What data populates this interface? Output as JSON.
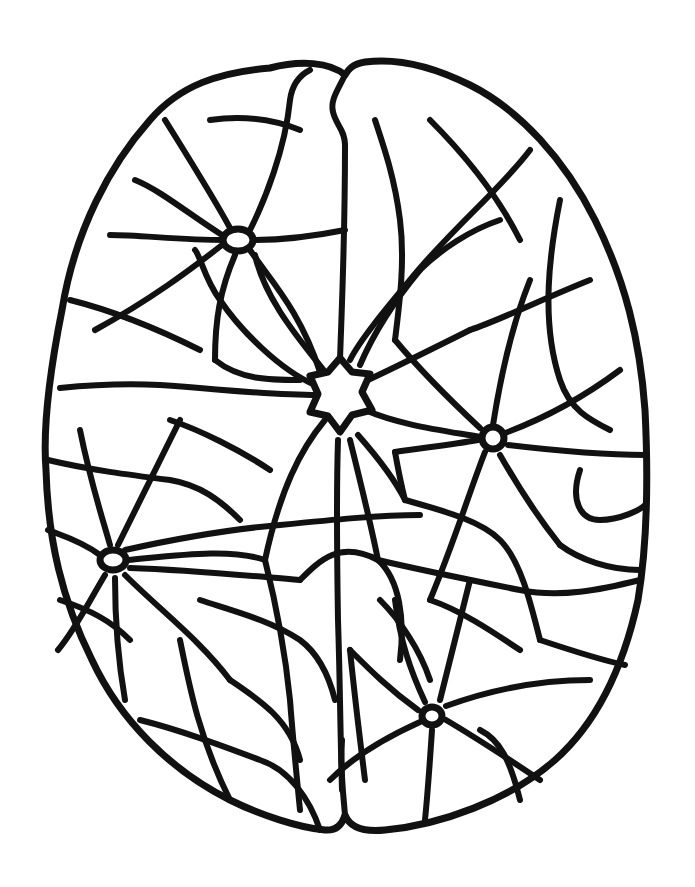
{
  "illustration": {
    "subject": "Brain viewed from above, filled with a neuron-like network",
    "style": "black line art on white background",
    "colors": {
      "line": "#111111",
      "background": "#ffffff"
    },
    "nodes": [
      {
        "name": "central-neuron",
        "x": 340,
        "y": 398,
        "shape": "star"
      },
      {
        "name": "upper-left-neuron",
        "x": 238,
        "y": 240
      },
      {
        "name": "right-neuron",
        "x": 493,
        "y": 438
      },
      {
        "name": "left-neuron",
        "x": 113,
        "y": 560
      },
      {
        "name": "lower-right-neuron",
        "x": 432,
        "y": 716
      }
    ]
  }
}
